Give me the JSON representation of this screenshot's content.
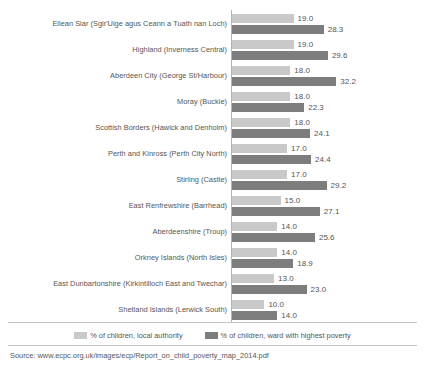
{
  "chart_data": {
    "type": "bar",
    "title": "",
    "subtitle": "",
    "xlabel": "",
    "ylabel": "",
    "orientation": "horizontal",
    "grid": false,
    "legend_position": "bottom-center",
    "xlim": [
      0,
      33
    ],
    "categories": [
      "Eilean Siar (Sgir'Uige agus Ceann a Tuath nan Loch)",
      "Highland (Inverness Central)",
      "Aberdeen City (George St/Harbour)",
      "Moray (Buckie)",
      "Scottish Borders (Hawick and Denholm)",
      "Perth and Kinross (Perth City North)",
      "Stirling (Castle)",
      "East Renfrewshire (Barrhead)",
      "Aberdeenshire (Troup)",
      "Orkney Islands (North Isles)",
      "East Dunbartonshire (Kirkintilloch East and Twechar)",
      "Shetland Islands (Lerwick South)"
    ],
    "series": [
      {
        "name": "% of children, local authority",
        "color": "#c9c9c9",
        "values": [
          19.0,
          19.0,
          18.0,
          18.0,
          18.0,
          17.0,
          17.0,
          15.0,
          14.0,
          14.0,
          13.0,
          10.0
        ],
        "labels": [
          "19.0",
          "19.0",
          "18.0",
          "18.0",
          "18.0",
          "17.0",
          "17.0",
          "15.0",
          "14.0",
          "14.0",
          "13.0",
          "10.0"
        ]
      },
      {
        "name": "% of children, ward with highest poverty",
        "color": "#7d7d7d",
        "values": [
          28.3,
          29.6,
          32.2,
          22.3,
          24.1,
          24.4,
          29.2,
          27.1,
          25.6,
          18.9,
          23.0,
          14.0
        ],
        "labels": [
          "28.3",
          "29.6",
          "32.2",
          "22.3",
          "24.1",
          "24.4",
          "29.2",
          "27.1",
          "25.6",
          "18.9",
          "23.0",
          "14.0"
        ]
      }
    ]
  },
  "legend": {
    "items": [
      {
        "label": "% of children, local authority",
        "color": "#c9c9c9"
      },
      {
        "label": "% of children, ward with highest poverty",
        "color": "#7d7d7d"
      }
    ]
  },
  "source": {
    "text": "Source: www.ecpc.org.uk/images/ecp/Report_on_child_poverty_map_2014.pdf"
  }
}
